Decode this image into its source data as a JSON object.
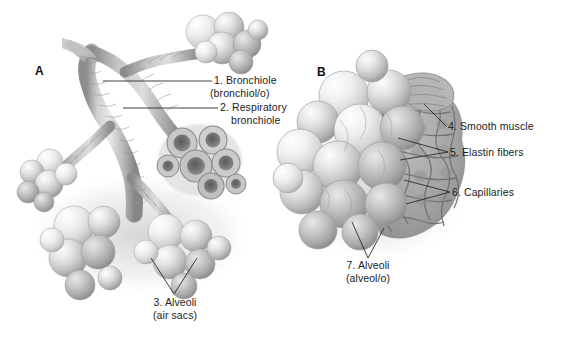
{
  "figure": {
    "background_color": "#ffffff",
    "line_color": "#2a2a2a",
    "art_style": "grayscale pencil/airbrush medical illustration"
  },
  "panels": [
    {
      "id": "A",
      "letter": "A",
      "description": "Terminal bronchiole branching into respiratory bronchioles and alveolar sacs, with a cut-away cluster of alveoli"
    },
    {
      "id": "B",
      "letter": "B",
      "description": "Close-up of an alveolar sac cluster showing smooth muscle, elastin fibers and capillary network"
    }
  ],
  "labels": [
    {
      "number": "1.",
      "name": "Bronchiole",
      "term": "(bronchiol/o)",
      "panel": "A"
    },
    {
      "number": "2.",
      "name": "Respiratory",
      "name_line2": "bronchiole",
      "term": "",
      "panel": "A"
    },
    {
      "number": "3.",
      "name": "Alveoli",
      "term": "(air sacs)",
      "panel": "A"
    },
    {
      "number": "4.",
      "name": "Smooth muscle",
      "term": "",
      "panel": "B"
    },
    {
      "number": "5.",
      "name": "Elastin fibers",
      "term": "",
      "panel": "B"
    },
    {
      "number": "6.",
      "name": "Capillaries",
      "term": "",
      "panel": "B"
    },
    {
      "number": "7.",
      "name": "Alveoli",
      "term": "(alveol/o)",
      "panel": "B"
    }
  ],
  "label_strings": {
    "l1_main": "1. Bronchiole",
    "l1_sub": "(bronchiol/o)",
    "l2_main": "2. Respiratory",
    "l2_sub": "bronchiole",
    "l3_main": "3. Alveoli",
    "l3_sub": "(air sacs)",
    "l4_main": "4. Smooth muscle",
    "l5_main": "5. Elastin fibers",
    "l6_main": "6. Capillaries",
    "l7_main": "7. Alveoli",
    "l7_sub": "(alveol/o)"
  }
}
